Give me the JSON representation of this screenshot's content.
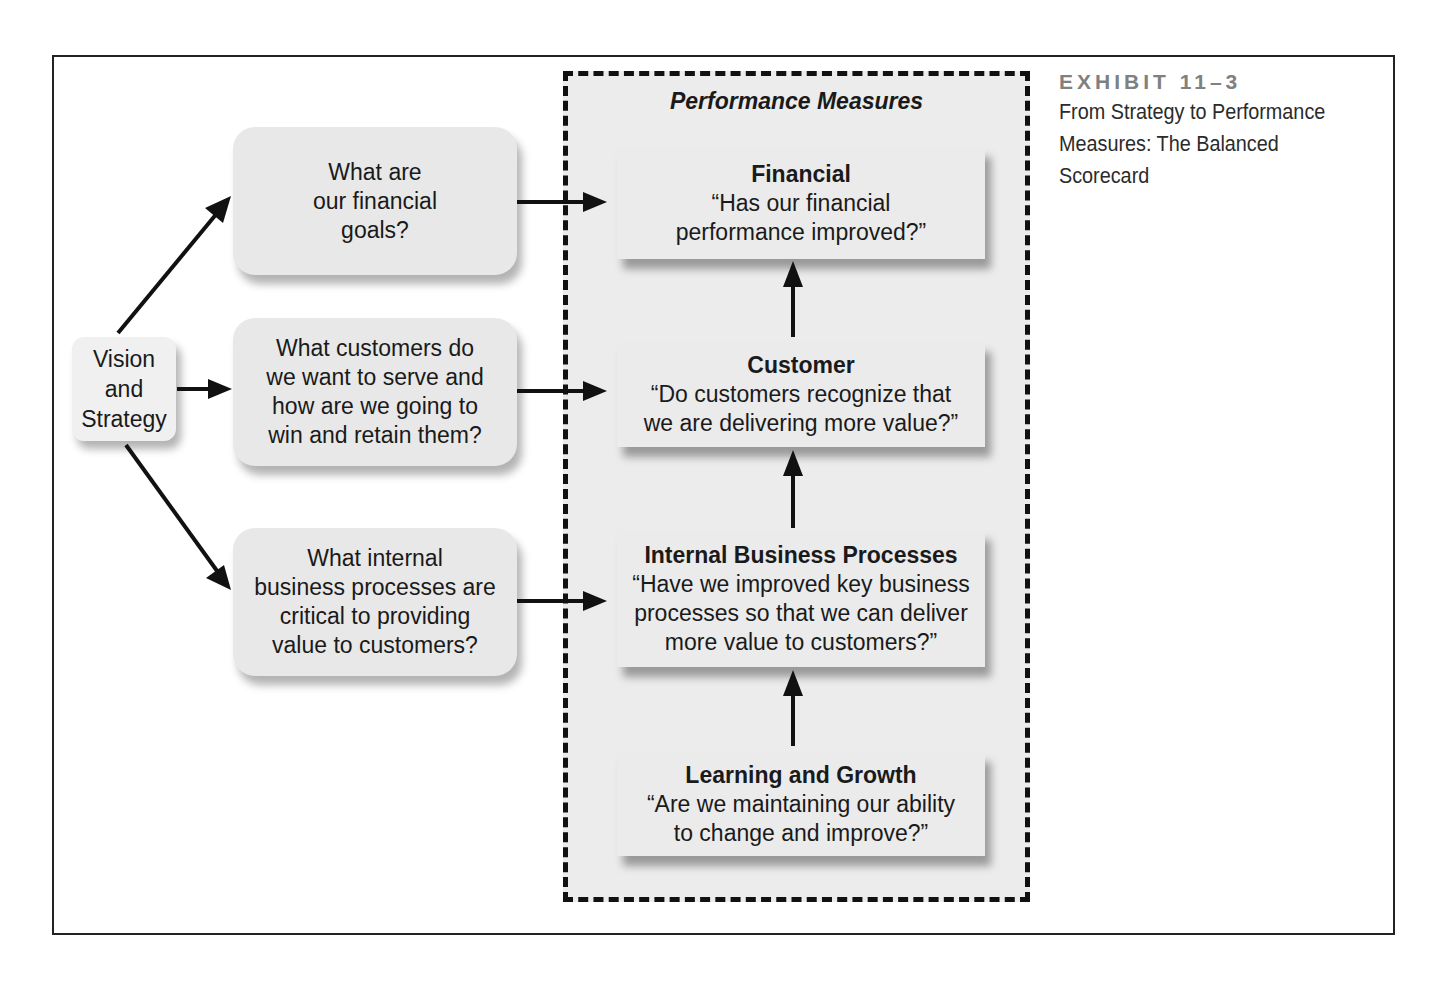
{
  "caption": {
    "exhibit": "EXHIBIT 11–3",
    "title": "From Strategy to Performance Measures: The Balanced Scorecard"
  },
  "vision": {
    "label": "Vision\nand\nStrategy"
  },
  "questions": [
    {
      "text": "What are\nour financial\ngoals?"
    },
    {
      "text": "What customers do\nwe want to serve and\nhow are we going to\nwin and retain them?"
    },
    {
      "text": "What internal\nbusiness processes are\ncritical to providing\nvalue to customers?"
    }
  ],
  "performance_measures": {
    "title": "Performance Measures",
    "boxes": [
      {
        "title": "Financial",
        "line1": "“Has our financial",
        "line2": "performance improved?”",
        "line3": ""
      },
      {
        "title": "Customer",
        "line1": "“Do customers recognize that",
        "line2": "we are delivering more value?”",
        "line3": ""
      },
      {
        "title": "Internal Business Processes",
        "line1": "“Have we improved key business",
        "line2": "processes so that we can deliver",
        "line3": "more value to customers?”"
      },
      {
        "title": "Learning and Growth",
        "line1": "“Are we maintaining our ability",
        "line2": "to change and improve?”",
        "line3": ""
      }
    ]
  },
  "colors": {
    "box_fill": "#ebebeb",
    "region_fill": "#ececec",
    "border": "#111111",
    "exhibit_label": "#808080"
  }
}
